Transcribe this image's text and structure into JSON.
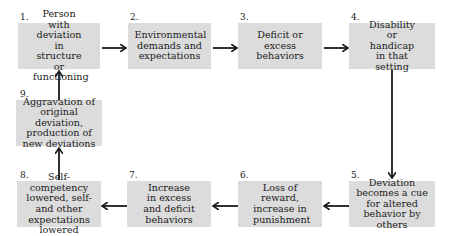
{
  "diagram": {
    "nodes": [
      {
        "id": 1,
        "number": "1.",
        "label": "Person with deviation in structure or functioning"
      },
      {
        "id": 2,
        "number": "2.",
        "label": "Environmental demands and expectations"
      },
      {
        "id": 3,
        "number": "3.",
        "label": "Deficit or excess behaviors"
      },
      {
        "id": 4,
        "number": "4.",
        "label": "Disability or handicap in that setting"
      },
      {
        "id": 5,
        "number": "5.",
        "label": "Deviation becomes a cue for altered behavior by others"
      },
      {
        "id": 6,
        "number": "6.",
        "label": "Loss of reward, increase in punishment"
      },
      {
        "id": 7,
        "number": "7.",
        "label": "Increase in excess and deficit behaviors"
      },
      {
        "id": 8,
        "number": "8.",
        "label": "Self-competency lowered, self-and other expectations lowered"
      },
      {
        "id": 9,
        "number": "9.",
        "label": "Aggravation of original deviation, production of new deviations"
      }
    ],
    "edges": [
      {
        "from": 1,
        "to": 2
      },
      {
        "from": 2,
        "to": 3
      },
      {
        "from": 3,
        "to": 4
      },
      {
        "from": 4,
        "to": 5
      },
      {
        "from": 5,
        "to": 6
      },
      {
        "from": 6,
        "to": 7
      },
      {
        "from": 7,
        "to": 8
      },
      {
        "from": 8,
        "to": 9
      },
      {
        "from": 9,
        "to": 1
      }
    ],
    "colors": {
      "box_fill": "#dcdcdc",
      "arrow": "#1a1a1a",
      "text": "#1a1a1a"
    }
  }
}
